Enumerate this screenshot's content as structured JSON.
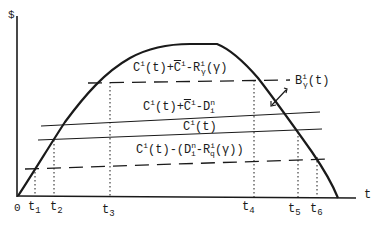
{
  "figure": {
    "y_axis_label": "$",
    "x_axis_label": "t",
    "origin_label": "0",
    "time_ticks": [
      {
        "base": "t",
        "sub": "1"
      },
      {
        "base": "t",
        "sub": "2"
      },
      {
        "base": "t",
        "sub": "3"
      },
      {
        "base": "t",
        "sub": "4"
      },
      {
        "base": "t",
        "sub": "5"
      },
      {
        "base": "t",
        "sub": "6"
      }
    ],
    "curve_label": {
      "base": "B",
      "sup": "i",
      "sub": "γ",
      "arg": "(t)"
    },
    "line_labels": {
      "upper_dashed": "C^i(t)+C̄^i−R^i_γ(γ)",
      "solid_upper": "C^i(t)+C̄^i−D^n_i",
      "solid_lower": "C^i(t)",
      "lower_dashed": "C^i(t)−(D^n_i−R^i_q(γ))"
    },
    "parts": {
      "c": "C",
      "i": "i",
      "t_arg": "(t)",
      "plus": "+",
      "minus": "-",
      "r": "R",
      "gamma": "γ",
      "gamma_arg": "(γ)",
      "d": "D",
      "n": "n",
      "q": "q",
      "open_paren": "-(D",
      "close": "(γ))"
    },
    "colors": {
      "ink": "#1a1a1a",
      "background": "#ffffff"
    }
  }
}
